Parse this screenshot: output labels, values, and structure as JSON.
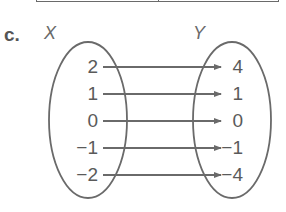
{
  "part_label": "c.",
  "domain_set": {
    "label": "X",
    "values": [
      "2",
      "1",
      "0",
      "−1",
      "−2"
    ]
  },
  "range_set": {
    "label": "Y",
    "values": [
      "4",
      "1",
      "0",
      "−1",
      "−4"
    ]
  },
  "mappings": [
    {
      "from": "2",
      "to": "4"
    },
    {
      "from": "1",
      "to": "1"
    },
    {
      "from": "0",
      "to": "0"
    },
    {
      "from": "−1",
      "to": "−1"
    },
    {
      "from": "−2",
      "to": "−4"
    }
  ],
  "colors": {
    "stroke": "#6a6a6a",
    "text": "#5a5a5a"
  }
}
